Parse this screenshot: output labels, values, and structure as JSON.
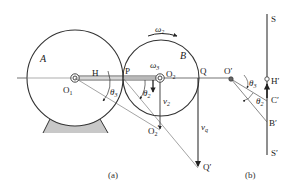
{
  "figure": {
    "panel_a": {
      "caption": "(a)",
      "wheel_a_label": "A",
      "wheel_b_label": "B",
      "points": {
        "o1": "O",
        "o1_sub": "1",
        "h": "H",
        "p": "P",
        "o2": "O",
        "o2_sub": "2",
        "q": "Q",
        "o2_prime": "O",
        "o2_prime_sub": "2",
        "o2_prime_mark": "′",
        "q_prime": "Q′"
      },
      "omega2": "ω",
      "omega2_sub": "2",
      "omega3": "ω",
      "omega3_sub": "3",
      "theta3": "θ",
      "theta3_sub": "3",
      "theta2": "θ",
      "theta2_sub": "2",
      "v2": "v",
      "v2_sub": "2",
      "vq": "v",
      "vq_sub": "q"
    },
    "panel_b": {
      "caption": "(b)",
      "s": "S",
      "s_prime": "S′",
      "o_prime": "O′",
      "h_prime": "H′",
      "c_prime": "C′",
      "b_prime": "B′",
      "theta3": "θ",
      "theta3_sub": "3",
      "theta2": "θ",
      "theta2_sub": "2"
    },
    "colors": {
      "stroke": "#333333",
      "thin": "#666666",
      "base_fill": "#c8c8c8"
    }
  }
}
